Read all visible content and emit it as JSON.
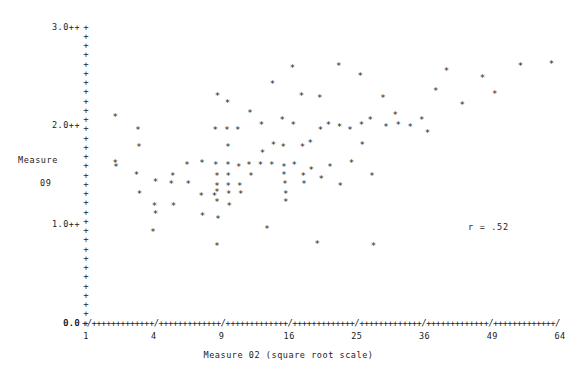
{
  "chart_data": {
    "type": "scatter",
    "title": "",
    "xlabel": "Measure 02 (square root scale)",
    "ylabel_line1": "Measure",
    "ylabel_line2": "09",
    "annotation": "r = .52",
    "x_scale": "square root",
    "xlim": [
      1,
      64
    ],
    "ylim": [
      0.0,
      3.0
    ],
    "x_ticks": [
      1,
      4,
      9,
      16,
      25,
      36,
      49,
      64
    ],
    "x_tick_labels": [
      "1",
      "4",
      "9",
      "16",
      "25",
      "36",
      "49",
      "64"
    ],
    "y_ticks": [
      0.0,
      1.0,
      2.0,
      3.0
    ],
    "y_tick_labels": [
      "0.0",
      "1.0++",
      "2.0++",
      "3.0++"
    ],
    "grid": false,
    "legend": "none",
    "marker": "*",
    "axis_glyph_plus": "+",
    "axis_glyph_slash": "/",
    "n_points": 96,
    "points": [
      [
        2.05,
        1.62
      ],
      [
        2.05,
        2.08
      ],
      [
        2.08,
        1.58
      ],
      [
        3.05,
        1.5
      ],
      [
        3.12,
        1.95
      ],
      [
        3.18,
        1.78
      ],
      [
        3.2,
        1.3
      ],
      [
        3.95,
        0.92
      ],
      [
        4.05,
        1.18
      ],
      [
        4.1,
        1.42
      ],
      [
        4.1,
        1.1
      ],
      [
        5.1,
        1.4
      ],
      [
        5.2,
        1.48
      ],
      [
        5.25,
        1.18
      ],
      [
        6.2,
        1.6
      ],
      [
        6.3,
        1.4
      ],
      [
        7.3,
        1.28
      ],
      [
        7.35,
        1.62
      ],
      [
        7.4,
        1.08
      ],
      [
        8.4,
        1.28
      ],
      [
        8.45,
        1.95
      ],
      [
        8.5,
        1.6
      ],
      [
        8.6,
        1.48
      ],
      [
        8.6,
        1.38
      ],
      [
        8.6,
        1.32
      ],
      [
        8.6,
        1.22
      ],
      [
        8.65,
        2.3
      ],
      [
        8.7,
        1.05
      ],
      [
        9.5,
        1.95
      ],
      [
        9.55,
        2.22
      ],
      [
        9.58,
        1.78
      ],
      [
        9.6,
        1.6
      ],
      [
        9.62,
        1.48
      ],
      [
        9.62,
        1.38
      ],
      [
        9.65,
        1.3
      ],
      [
        9.7,
        1.18
      ],
      [
        10.5,
        1.95
      ],
      [
        10.6,
        1.58
      ],
      [
        10.7,
        1.38
      ],
      [
        10.8,
        1.3
      ],
      [
        11.6,
        1.6
      ],
      [
        11.7,
        2.12
      ],
      [
        11.8,
        1.48
      ],
      [
        12.8,
        1.6
      ],
      [
        12.9,
        2.0
      ],
      [
        13.0,
        1.72
      ],
      [
        14.0,
        1.6
      ],
      [
        14.1,
        2.42
      ],
      [
        14.2,
        1.8
      ],
      [
        15.2,
        2.05
      ],
      [
        15.3,
        1.78
      ],
      [
        15.4,
        1.58
      ],
      [
        15.4,
        1.5
      ],
      [
        15.5,
        1.4
      ],
      [
        15.6,
        1.3
      ],
      [
        15.6,
        1.22
      ],
      [
        16.4,
        2.58
      ],
      [
        16.5,
        2.0
      ],
      [
        16.6,
        1.6
      ],
      [
        17.5,
        2.3
      ],
      [
        17.6,
        1.78
      ],
      [
        17.7,
        1.48
      ],
      [
        17.8,
        1.4
      ],
      [
        18.6,
        1.82
      ],
      [
        18.7,
        1.55
      ],
      [
        19.8,
        2.28
      ],
      [
        19.9,
        1.95
      ],
      [
        20.0,
        1.45
      ],
      [
        21.0,
        2.0
      ],
      [
        21.2,
        1.58
      ],
      [
        22.4,
        2.6
      ],
      [
        22.5,
        1.98
      ],
      [
        22.6,
        1.38
      ],
      [
        24.0,
        1.95
      ],
      [
        24.2,
        1.62
      ],
      [
        25.5,
        2.5
      ],
      [
        25.7,
        2.0
      ],
      [
        25.8,
        1.8
      ],
      [
        27.0,
        2.05
      ],
      [
        27.3,
        1.48
      ],
      [
        29.0,
        2.28
      ],
      [
        29.5,
        1.98
      ],
      [
        31.0,
        2.1
      ],
      [
        31.5,
        2.0
      ],
      [
        33.5,
        1.98
      ],
      [
        35.5,
        2.05
      ],
      [
        36.5,
        1.92
      ],
      [
        38.0,
        2.35
      ],
      [
        40.0,
        2.55
      ],
      [
        43.0,
        2.2
      ],
      [
        47.0,
        2.48
      ],
      [
        49.5,
        2.32
      ],
      [
        55.0,
        2.6
      ],
      [
        62.0,
        2.62
      ],
      [
        8.6,
        0.78
      ],
      [
        13.5,
        0.95
      ],
      [
        19.5,
        0.8
      ],
      [
        27.5,
        0.78
      ]
    ]
  },
  "plot_geometry": {
    "x_axis_pixel_left": 86,
    "x_axis_pixel_right": 560,
    "x_axis_pixel_y": 323,
    "y_axis_pixel_x": 86,
    "y_axis_pixel_top": 27,
    "y_axis_pixel_bottom": 323,
    "y_tick_count": 33
  },
  "axis_render": {
    "x_axis_string": "+/+++++++++++++/+++++++++++++/+++++++++++++/+++++++++++++/+++++++++++++/+++++++++++++/+++++++++++++/",
    "zero_label": "0.0"
  }
}
